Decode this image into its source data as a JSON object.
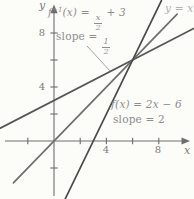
{
  "chart_data": {
    "type": "line",
    "title": "",
    "xlabel": "x",
    "ylabel": "y",
    "x_range": [
      -3.8,
      10.3
    ],
    "y_range": [
      -4.2,
      10.1
    ],
    "grid": false,
    "tick_step": 2,
    "x_ticks": [
      -2,
      2,
      4,
      6,
      8
    ],
    "y_ticks": [
      -2,
      2,
      4,
      6,
      8
    ],
    "x_tick_labels": [
      "4",
      "8"
    ],
    "y_tick_labels": [
      "4",
      "8"
    ],
    "intersection_point": [
      6,
      6
    ],
    "series": [
      {
        "name": "f-inverse",
        "equation": "f^-1(x) = x/2 + 3",
        "slope": 0.5,
        "points": [
          [
            -4.1,
            0.95
          ],
          [
            10.7,
            8.35
          ]
        ],
        "color": "#565656"
      },
      {
        "name": "identity",
        "equation": "y = x",
        "slope": 1,
        "points": [
          [
            -3.1,
            -3.1
          ],
          [
            9.4,
            9.4
          ]
        ],
        "color": "#6f6f6f"
      },
      {
        "name": "f",
        "equation": "f(x) = 2x - 6",
        "slope": 2,
        "points": [
          [
            0.85,
            -4.3
          ],
          [
            8.2,
            10.4
          ]
        ],
        "color": "#4a4a4a"
      }
    ],
    "annotations": {
      "f_inverse_label": {
        "prefix": "f",
        "sup": "−1",
        "mid": "(x) = ",
        "frac_num": "x",
        "frac_den": "2",
        "suffix": " + 3"
      },
      "f_inverse_slope": {
        "prefix": "slope = ",
        "frac_num": "1",
        "frac_den": "2"
      },
      "identity_label": "y = x",
      "f_label": "f(x) = 2x − 6",
      "f_slope": "slope = 2"
    },
    "colors": {
      "axis": "#6e6e6e",
      "label_text": "#8d8d8d",
      "identity_label_text": "#b2b2b2",
      "tick_text": "#7a7a7a",
      "leader_line": "#9a9a9a"
    }
  }
}
